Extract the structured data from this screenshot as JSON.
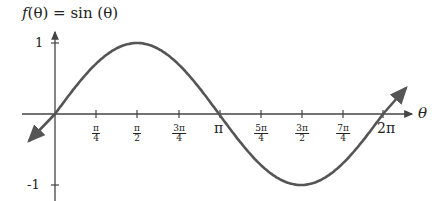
{
  "chart_data": {
    "type": "line",
    "xlabel": "θ",
    "ylabel": "",
    "x_ticks": [
      "π/4",
      "π/2",
      "3π/4",
      "π",
      "5π/4",
      "3π/2",
      "7π/4",
      "2π"
    ],
    "y_ticks": [
      "1",
      "-1"
    ],
    "xlim": [
      -0.4,
      6.9
    ],
    "ylim": [
      -1,
      1
    ],
    "grid": false,
    "legend": null,
    "series": [
      {
        "name": "sin(θ)",
        "color": "#555555",
        "x": [
          0,
          0.785,
          1.571,
          2.356,
          3.142,
          3.927,
          4.712,
          5.498,
          6.283
        ],
        "values": [
          0,
          0.707,
          1,
          0.707,
          0,
          -0.707,
          -1,
          -0.707,
          0
        ]
      }
    ]
  },
  "labels": {
    "title_f": "f",
    "title_rest": "(θ) = ",
    "title_sin": "sin",
    "title_arg": " (θ)",
    "x_axis": "θ",
    "y1": "1",
    "ym1": "-1",
    "pi": "π",
    "two_pi": "2π",
    "ticks": [
      {
        "num": "π",
        "den": "4"
      },
      {
        "num": "π",
        "den": "2"
      },
      {
        "num": "3π",
        "den": "4"
      },
      {
        "num": "5π",
        "den": "4"
      },
      {
        "num": "3π",
        "den": "2"
      },
      {
        "num": "7π",
        "den": "4"
      }
    ]
  }
}
